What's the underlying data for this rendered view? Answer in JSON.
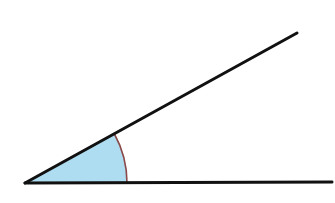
{
  "figure": {
    "type": "geometry-angle-diagram",
    "width": 335,
    "height": 203,
    "background_color": "#FFFFFF",
    "vertex": {
      "x": 25,
      "y": 183,
      "label": ""
    },
    "rays": [
      {
        "name": "horizontal-ray",
        "from": {
          "x": 25,
          "y": 183
        },
        "to": {
          "x": 332,
          "y": 182
        },
        "color": "#111111",
        "stroke_width": 3
      },
      {
        "name": "diagonal-ray",
        "from": {
          "x": 25,
          "y": 183
        },
        "to": {
          "x": 297,
          "y": 33
        },
        "color": "#111111",
        "stroke_width": 3
      }
    ],
    "angle_arc": {
      "name": "angle-arc",
      "radius": 102,
      "start": {
        "x": 127,
        "y": 183
      },
      "end": {
        "x": 115,
        "y": 139
      },
      "start_angle_deg": 0,
      "end_angle_deg": 28.9,
      "color": "#8B4A4A",
      "stroke_width": 1.6
    },
    "sector_fill": {
      "name": "angle-sector",
      "color": "#AEDCF0",
      "opacity": 1
    },
    "measure": {
      "angle_degrees": 28.9,
      "label_visible": false,
      "label_text": ""
    }
  }
}
